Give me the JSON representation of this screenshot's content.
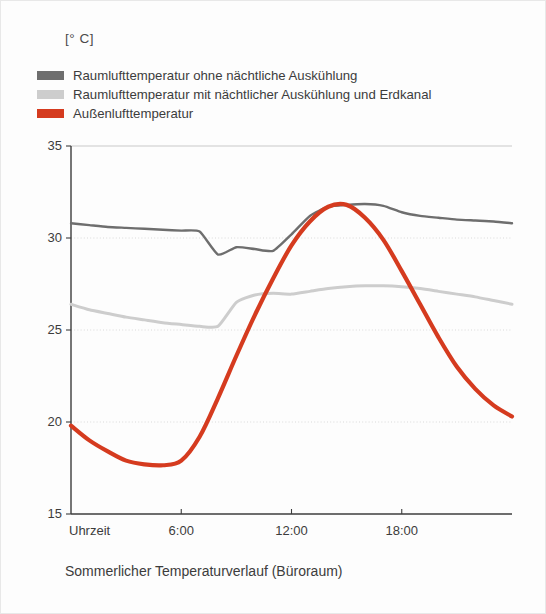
{
  "unit_label": "[° C]",
  "caption": "Sommerlicher Temperaturverlauf (Büroraum)",
  "colors": {
    "series_dark_gray": "#6e6e6e",
    "series_light_gray": "#cdcdcd",
    "series_red": "#d53b1f",
    "gridline": "#d9d9d9",
    "axis": "#3c3c3c",
    "background": "#fdfdfd",
    "text": "#3c3c3c"
  },
  "legend": {
    "items": [
      {
        "label": "Raumlufttemperatur ohne nächtliche Auskühlung",
        "color": "#6e6e6e",
        "swatch": "swatch-dark-gray"
      },
      {
        "label": "Raumlufttemperatur mit nächtlicher Auskühlung und Erdkanal",
        "color": "#cdcdcd",
        "swatch": "swatch-light-gray"
      },
      {
        "label": "Außenlufttemperatur",
        "color": "#d53b1f",
        "swatch": "swatch-red"
      }
    ]
  },
  "chart_data": {
    "type": "line",
    "title": "Sommerlicher Temperaturverlauf (Büroraum)",
    "xlabel": "Uhrzeit",
    "ylabel": "[° C]",
    "ylim": [
      15,
      35
    ],
    "xlim": [
      0,
      24
    ],
    "grid": true,
    "legend_position": "top-left",
    "ytick_labels": [
      "35",
      "30",
      "25",
      "20",
      "15"
    ],
    "ytick_values": [
      35,
      30,
      25,
      20,
      15
    ],
    "xtick_labels": [
      "Uhrzeit",
      "6:00",
      "12:00",
      "18:00"
    ],
    "xtick_values": [
      0,
      6,
      12,
      18
    ],
    "x": [
      0,
      1,
      2,
      3,
      4,
      5,
      6,
      7,
      8,
      9,
      10,
      11,
      12,
      13,
      14,
      15,
      16,
      17,
      18,
      19,
      20,
      21,
      22,
      23,
      24
    ],
    "series": [
      {
        "name": "Raumlufttemperatur ohne nächtliche Auskühlung",
        "color": "#6e6e6e",
        "width": 2.4,
        "values": [
          30.8,
          30.7,
          30.6,
          30.55,
          30.5,
          30.45,
          30.4,
          30.35,
          29.1,
          29.5,
          29.4,
          29.3,
          30.2,
          31.2,
          31.7,
          31.8,
          31.85,
          31.75,
          31.4,
          31.2,
          31.1,
          31.0,
          30.95,
          30.9,
          30.8
        ]
      },
      {
        "name": "Raumlufttemperatur mit nächtlicher Auskühlung und Erdkanal",
        "color": "#cdcdcd",
        "width": 3.0,
        "values": [
          26.4,
          26.1,
          25.9,
          25.7,
          25.55,
          25.4,
          25.3,
          25.2,
          25.2,
          26.5,
          26.9,
          27.0,
          26.95,
          27.1,
          27.25,
          27.35,
          27.4,
          27.4,
          27.35,
          27.25,
          27.1,
          26.95,
          26.8,
          26.6,
          26.4
        ]
      },
      {
        "name": "Außenlufttemperatur",
        "color": "#d53b1f",
        "width": 4.2,
        "values": [
          19.8,
          19.0,
          18.4,
          17.9,
          17.7,
          17.65,
          17.9,
          19.2,
          21.3,
          23.6,
          25.8,
          27.8,
          29.6,
          30.9,
          31.7,
          31.8,
          31.1,
          29.9,
          28.2,
          26.4,
          24.6,
          23.0,
          21.8,
          20.9,
          20.3
        ]
      }
    ]
  }
}
